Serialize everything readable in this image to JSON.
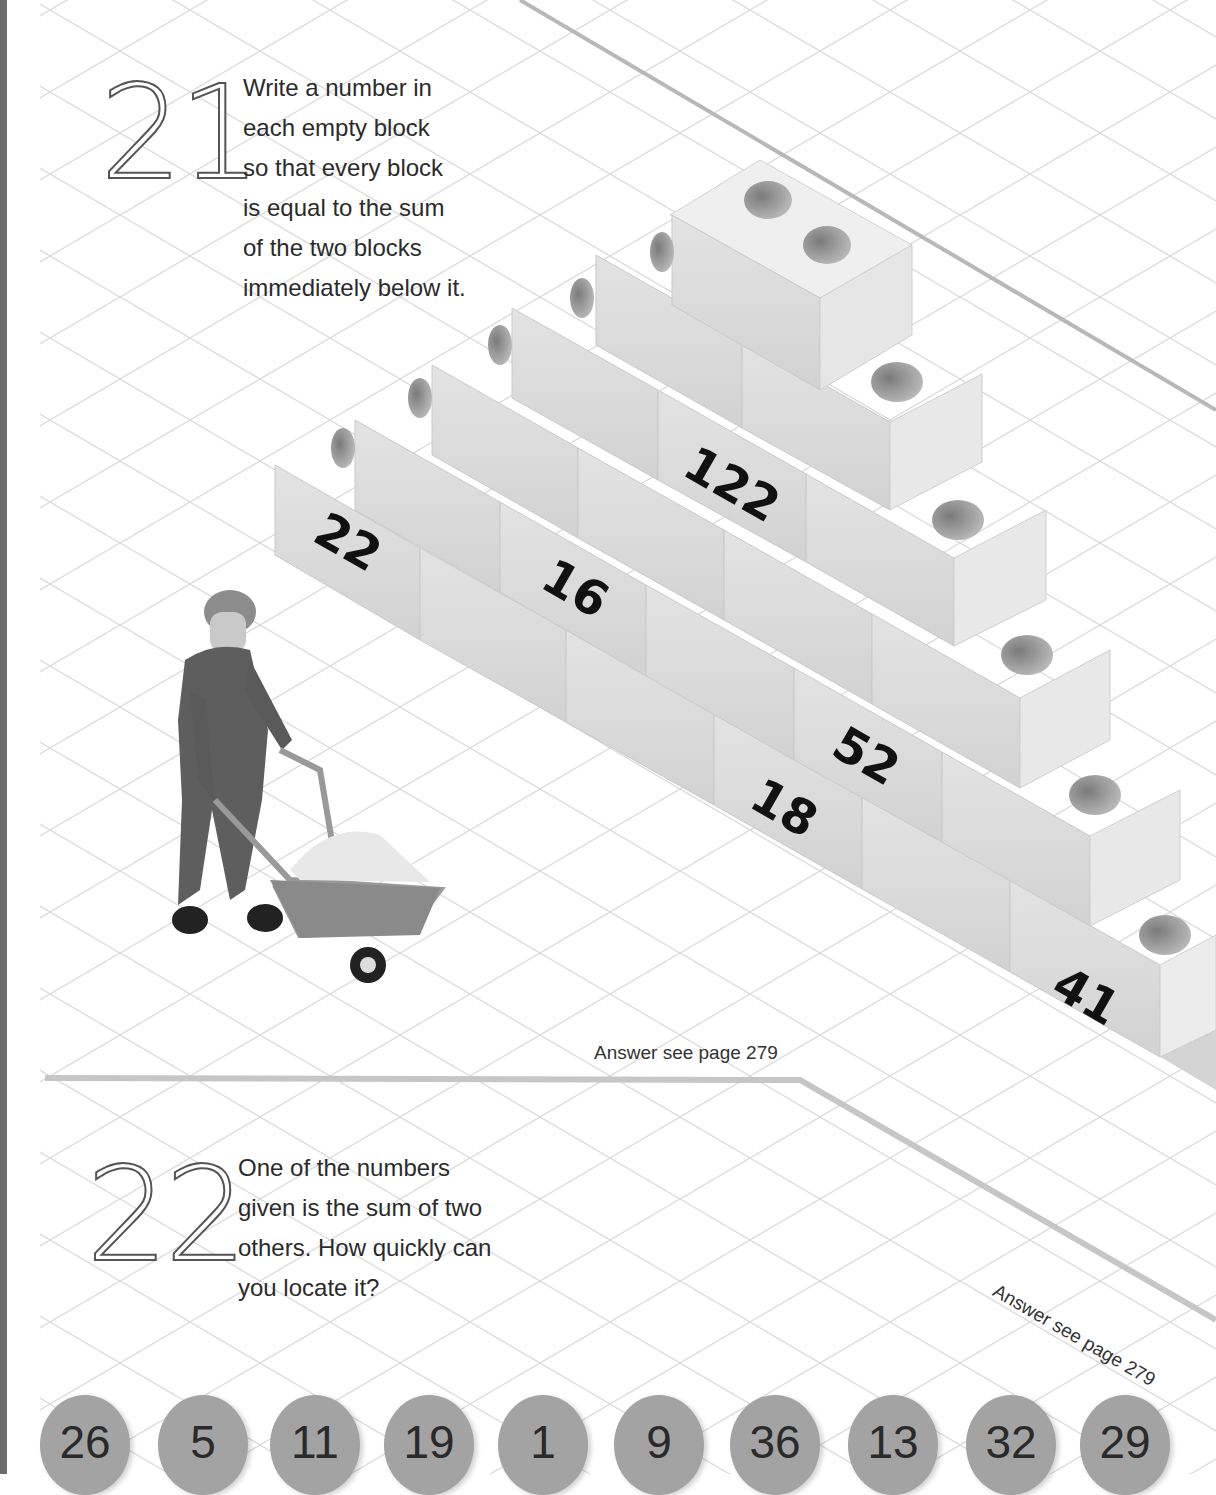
{
  "puzzle21": {
    "number": "21",
    "text_lines": [
      "Write a number in",
      "each empty block",
      "so that every block",
      "is equal to the sum",
      "of the two blocks",
      "immediately below it."
    ],
    "answer_ref": "Answer see page 279",
    "pyramid": {
      "rows": [
        [
          "",
          "",
          "",
          "",
          "",
          ""
        ],
        [
          "",
          "",
          "",
          "",
          ""
        ],
        [
          "",
          "",
          "",
          ""
        ],
        [
          "",
          "",
          ""
        ],
        [
          "",
          ""
        ],
        [
          ""
        ]
      ],
      "given": [
        {
          "label": "22"
        },
        {
          "label": "16"
        },
        {
          "label": "122"
        },
        {
          "label": "52"
        },
        {
          "label": "18"
        },
        {
          "label": "41"
        }
      ]
    }
  },
  "puzzle22": {
    "number": "22",
    "text_lines": [
      "One of the numbers",
      "given is the sum of two",
      "others. How quickly can",
      "you locate it?"
    ],
    "answer_ref": "Answer see page 279",
    "numbers": [
      "26",
      "5",
      "11",
      "19",
      "1",
      "9",
      "36",
      "13",
      "32",
      "29"
    ]
  },
  "colors": {
    "left_bar": "#6b6b6b",
    "grid": "#d8d8d8",
    "divider": "#c4c4c4",
    "block_front": "#dcdcdc",
    "block_top": "#ececec",
    "block_side": "#e6e6e6",
    "circle": "#a3a3a3"
  }
}
